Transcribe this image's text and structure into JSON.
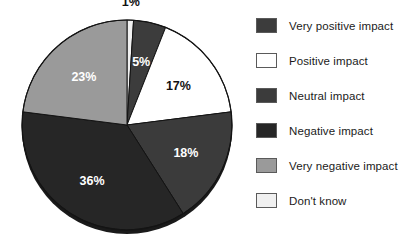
{
  "chart_data": {
    "type": "pie",
    "title": "",
    "subtitle": "",
    "xlabel": "",
    "ylabel": "",
    "legend_position": "right",
    "grid": false,
    "categories": [
      "Very positive impact",
      "Positive impact",
      "Neutral impact",
      "Negative impact",
      "Very negative impact",
      "Don't know"
    ],
    "values": [
      5,
      17,
      18,
      36,
      23,
      1
    ],
    "value_labels": [
      "5%",
      "17%",
      "18%",
      "36%",
      "23%",
      "1%"
    ],
    "colors": [
      "#3c3c3c",
      "#ffffff",
      "#3b3b3b",
      "#262626",
      "#9a9a9a",
      "#f0f0f0"
    ],
    "slices": [
      {
        "label": "Don't know",
        "value": 1,
        "value_label": "1%",
        "color": "#f0f0f0",
        "label_color": "#111111",
        "label_outside": true
      },
      {
        "label": "Very positive impact",
        "value": 5,
        "value_label": "5%",
        "color": "#3c3c3c",
        "label_color": "#ffffff",
        "label_outside": false
      },
      {
        "label": "Positive impact",
        "value": 17,
        "value_label": "17%",
        "color": "#ffffff",
        "label_color": "#111111",
        "label_outside": false
      },
      {
        "label": "Neutral impact",
        "value": 18,
        "value_label": "18%",
        "color": "#3b3b3b",
        "label_color": "#ffffff",
        "label_outside": false
      },
      {
        "label": "Negative impact",
        "value": 36,
        "value_label": "36%",
        "color": "#262626",
        "label_color": "#ffffff",
        "label_outside": false
      },
      {
        "label": "Very negative impact",
        "value": 23,
        "value_label": "23%",
        "color": "#9a9a9a",
        "label_color": "#ffffff",
        "label_outside": false
      }
    ]
  },
  "legend": {
    "items": [
      {
        "label": "Very positive impact",
        "color": "#3c3c3c"
      },
      {
        "label": "Positive impact",
        "color": "#ffffff"
      },
      {
        "label": "Neutral impact",
        "color": "#3b3b3b"
      },
      {
        "label": "Negative impact",
        "color": "#262626"
      },
      {
        "label": "Very negative impact",
        "color": "#9a9a9a"
      },
      {
        "label": "Don't know",
        "color": "#f0f0f0"
      }
    ]
  }
}
